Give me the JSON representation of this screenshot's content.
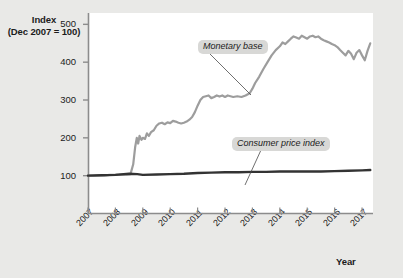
{
  "chart_data": {
    "type": "line",
    "title": "",
    "subtitle": "",
    "ylabel_line1": "Index",
    "ylabel_line2": "(Dec 2007 = 100)",
    "xlabel": "Year",
    "xlim": [
      2007,
      2017.4
    ],
    "ylim": [
      0,
      530
    ],
    "yticks": [
      100,
      200,
      300,
      400,
      500
    ],
    "ytick_labels": [
      "100",
      "200",
      "300",
      "400",
      "500"
    ],
    "xticks": [
      2007,
      2008,
      2009,
      2010,
      2011,
      2012,
      2013,
      2014,
      2015,
      2016,
      2017
    ],
    "xtick_labels": [
      "2007",
      "2008",
      "2009",
      "2010",
      "2011",
      "2012",
      "2013",
      "2014",
      "2015",
      "2016",
      "2017"
    ],
    "grid": false,
    "legend_position": "inline-annotations",
    "annotations": [
      {
        "name": "monetary-base-label",
        "text": "Monetary base"
      },
      {
        "name": "consumer-price-index-label",
        "text": "Consumer price index"
      }
    ],
    "series": [
      {
        "name": "Monetary base",
        "color": "#9d9d9d",
        "x": [
          2007.0,
          2007.2,
          2007.4,
          2007.6,
          2007.8,
          2008.0,
          2008.2,
          2008.4,
          2008.55,
          2008.65,
          2008.72,
          2008.78,
          2008.83,
          2008.88,
          2008.95,
          2009.0,
          2009.08,
          2009.15,
          2009.22,
          2009.3,
          2009.4,
          2009.5,
          2009.6,
          2009.7,
          2009.8,
          2009.9,
          2010.0,
          2010.1,
          2010.2,
          2010.3,
          2010.4,
          2010.5,
          2010.6,
          2010.7,
          2010.8,
          2010.9,
          2011.0,
          2011.1,
          2011.2,
          2011.3,
          2011.4,
          2011.5,
          2011.6,
          2011.7,
          2011.8,
          2011.9,
          2012.0,
          2012.1,
          2012.2,
          2012.3,
          2012.45,
          2012.6,
          2012.75,
          2012.9,
          2013.0,
          2013.1,
          2013.25,
          2013.4,
          2013.55,
          2013.7,
          2013.85,
          2014.0,
          2014.1,
          2014.2,
          2014.3,
          2014.4,
          2014.5,
          2014.6,
          2014.7,
          2014.8,
          2014.9,
          2015.0,
          2015.1,
          2015.2,
          2015.3,
          2015.4,
          2015.5,
          2015.6,
          2015.7,
          2015.8,
          2015.9,
          2016.0,
          2016.1,
          2016.2,
          2016.3,
          2016.4,
          2016.5,
          2016.6,
          2016.7,
          2016.8,
          2016.9,
          2017.0,
          2017.1,
          2017.2,
          2017.3
        ],
        "values": [
          100,
          100,
          101,
          101,
          102,
          102,
          103,
          103,
          104,
          130,
          175,
          200,
          185,
          205,
          195,
          200,
          197,
          212,
          205,
          215,
          220,
          232,
          238,
          240,
          236,
          241,
          239,
          245,
          243,
          240,
          238,
          240,
          243,
          248,
          255,
          268,
          285,
          300,
          308,
          310,
          312,
          305,
          308,
          312,
          309,
          312,
          308,
          312,
          310,
          308,
          310,
          308,
          312,
          318,
          330,
          345,
          362,
          382,
          400,
          418,
          432,
          442,
          452,
          448,
          455,
          462,
          468,
          465,
          462,
          470,
          466,
          462,
          468,
          470,
          466,
          468,
          462,
          458,
          455,
          452,
          448,
          445,
          440,
          432,
          425,
          418,
          430,
          422,
          408,
          425,
          432,
          418,
          405,
          430,
          450
        ]
      },
      {
        "name": "Consumer price index",
        "color": "#333333",
        "x": [
          2007.0,
          2007.5,
          2008.0,
          2008.5,
          2008.8,
          2009.0,
          2009.5,
          2010.0,
          2010.5,
          2011.0,
          2011.5,
          2012.0,
          2012.5,
          2013.0,
          2013.5,
          2014.0,
          2014.5,
          2015.0,
          2015.5,
          2016.0,
          2016.5,
          2017.0,
          2017.3
        ],
        "values": [
          100,
          101,
          102,
          105,
          104,
          102,
          103,
          104,
          105,
          107,
          108,
          109,
          109,
          110,
          110,
          111,
          111,
          111,
          111,
          112,
          113,
          114,
          115
        ]
      }
    ]
  }
}
